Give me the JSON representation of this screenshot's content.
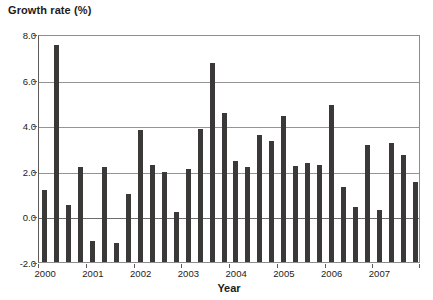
{
  "chart_data": {
    "type": "bar",
    "title": "",
    "ylabel": "Growth rate (%)",
    "xlabel": "Year",
    "ylim": [
      -2.0,
      8.0
    ],
    "grid": true,
    "legend": null,
    "y_ticks": [
      "8.0",
      "6.0",
      "4.0",
      "2.0",
      "0.0",
      "-2.0"
    ],
    "y_tick_values": [
      8.0,
      6.0,
      4.0,
      2.0,
      0.0,
      -2.0
    ],
    "x_tick_labels": [
      "2000",
      "2001",
      "2002",
      "2003",
      "2004",
      "2005",
      "2006",
      "2007"
    ],
    "bar_color": "#3b3838",
    "categories": [
      "2000Q1",
      "2000Q2",
      "2000Q3",
      "2000Q4",
      "2001Q1",
      "2001Q2",
      "2001Q3",
      "2001Q4",
      "2002Q1",
      "2002Q2",
      "2002Q3",
      "2002Q4",
      "2003Q1",
      "2003Q2",
      "2003Q3",
      "2003Q4",
      "2004Q1",
      "2004Q2",
      "2004Q3",
      "2004Q4",
      "2005Q1",
      "2005Q2",
      "2005Q3",
      "2005Q4",
      "2006Q1",
      "2006Q2",
      "2006Q3",
      "2006Q4",
      "2007Q1",
      "2007Q2",
      "2007Q3",
      "2007Q4"
    ],
    "values": [
      1.15,
      7.5,
      0.5,
      2.15,
      -1.1,
      2.15,
      -1.15,
      1.0,
      3.8,
      2.25,
      1.95,
      0.2,
      2.1,
      3.85,
      6.75,
      4.55,
      2.45,
      2.15,
      3.55,
      3.3,
      4.4,
      2.2,
      2.35,
      2.25,
      4.9,
      1.3,
      0.4,
      3.15,
      0.3,
      3.2,
      2.7,
      1.5
    ]
  }
}
